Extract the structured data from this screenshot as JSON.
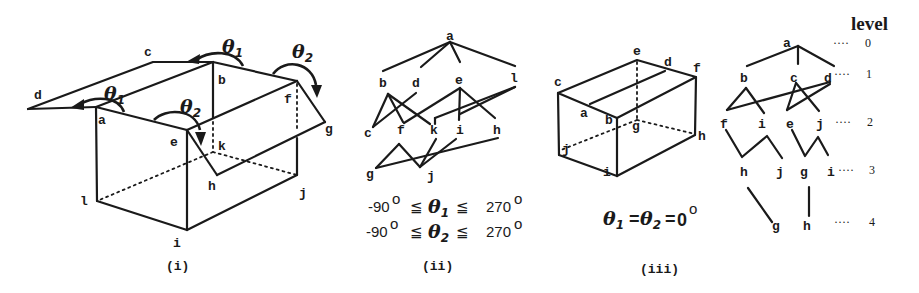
{
  "figure": {
    "panels": [
      {
        "id": "i",
        "caption": "(i)",
        "description": "open box with two flaps rotated by theta1 and theta2",
        "vertex_labels": {
          "a": "a",
          "b": "b",
          "c": "c",
          "d": "d",
          "e": "e",
          "f": "f",
          "g": "g",
          "h": "h",
          "i": "i",
          "j": "j",
          "k": "k",
          "l": "l"
        },
        "angle_labels": [
          {
            "symbol": "θ",
            "subscript": "1",
            "position": "top-center"
          },
          {
            "symbol": "θ",
            "subscript": "2",
            "position": "top-right"
          },
          {
            "symbol": "θ",
            "subscript": "1",
            "position": "left-flap"
          },
          {
            "symbol": "θ",
            "subscript": "2",
            "position": "front-center"
          }
        ]
      },
      {
        "id": "ii",
        "caption": "(ii)",
        "description": "tangled graph of faces",
        "nodes": [
          "a",
          "b",
          "d",
          "e",
          "l",
          "c",
          "f",
          "k",
          "i",
          "h",
          "g",
          "j"
        ],
        "constraints": [
          {
            "lower": "-90",
            "symbol": "θ",
            "subscript": "1",
            "upper": "270",
            "relation": "≦",
            "degree": "o"
          },
          {
            "lower": "-90",
            "symbol": "θ",
            "subscript": "2",
            "upper": "270",
            "relation": "≦",
            "degree": "o"
          }
        ]
      },
      {
        "id": "iii",
        "caption": "(iii)",
        "description": "closed box",
        "vertex_labels": {
          "a": "a",
          "b": "b",
          "c": "c",
          "d": "d",
          "e": "e",
          "f": "f",
          "g": "g",
          "h": "h",
          "i": "i",
          "j": "j"
        },
        "equation": {
          "theta1": "θ",
          "sub1": "1",
          "eq1": "=",
          "theta2": "θ",
          "sub2": "2",
          "eq2": "=",
          "value": "0",
          "degree": "o"
        }
      },
      {
        "id": "tree",
        "description": "hierarchical tree of faces by level",
        "level_title": "level",
        "levels": [
          {
            "level": "0",
            "nodes": [
              "a"
            ]
          },
          {
            "level": "1",
            "nodes": [
              "b",
              "c",
              "d"
            ]
          },
          {
            "level": "2",
            "nodes": [
              "f",
              "i",
              "e",
              "j"
            ]
          },
          {
            "level": "3",
            "nodes": [
              "h",
              "j",
              "g",
              "i"
            ]
          },
          {
            "level": "4",
            "nodes": [
              "g",
              "h"
            ]
          }
        ],
        "leader": "····"
      }
    ]
  }
}
